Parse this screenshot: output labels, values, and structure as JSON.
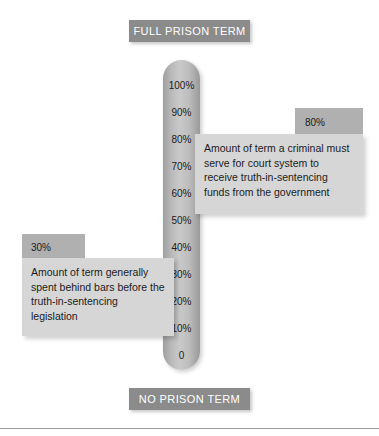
{
  "figure": {
    "title_top": "FULL PRISON TERM",
    "title_bottom": "NO PRISON TERM"
  },
  "gauge": {
    "ticks": [
      "100%",
      "90%",
      "80%",
      "70%",
      "60%",
      "50%",
      "40%",
      "30%",
      "20%",
      "10%",
      "0"
    ]
  },
  "callouts": {
    "upper": {
      "value": "80%",
      "text": "Amount of term a criminal must serve for court system to receive truth-in-sentencing funds from the government"
    },
    "lower": {
      "value": "30%",
      "text": "Amount of term generally spent behind bars before the truth-in-sentencing legislation"
    }
  },
  "chart_data": {
    "type": "bar",
    "xlabel": "",
    "ylabel": "Percent of full prison term",
    "ylim": [
      0,
      100
    ],
    "grid": false,
    "legend": "none",
    "axis_top_label": "FULL PRISON TERM",
    "axis_bottom_label": "NO PRISON TERM",
    "tick_labels": [
      "0",
      "10%",
      "20%",
      "30%",
      "40%",
      "50%",
      "60%",
      "70%",
      "80%",
      "90%",
      "100%"
    ],
    "categories": [
      "Amount of term generally spent behind bars before the truth-in-sentencing legislation",
      "Amount of term a criminal must serve for court system to receive truth-in-sentencing funds from the government"
    ],
    "values": [
      30,
      80
    ],
    "annotations": [
      {
        "value": 30,
        "label": "30%",
        "text": "Amount of term generally spent behind bars before the truth-in-sentencing legislation"
      },
      {
        "value": 80,
        "label": "80%",
        "text": "Amount of term a criminal must serve for court system to receive truth-in-sentencing funds from the government"
      }
    ],
    "colors": {
      "banner": "#8b8b8b",
      "gauge": "#bdbdbd",
      "callout_tab": "#b0b0b0",
      "callout_body": "#d6d6d6",
      "text": "#1b1b1b"
    }
  }
}
